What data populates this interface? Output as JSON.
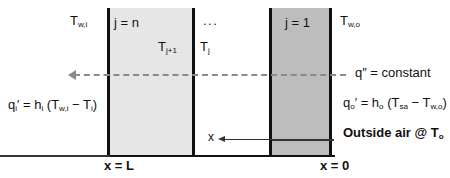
{
  "diagram": {
    "blocks": [
      {
        "id": "block-n",
        "label": "j = n",
        "fill": "#e6e6e6"
      },
      {
        "id": "block-mid",
        "label": "",
        "fill": "#ffffff"
      },
      {
        "id": "block-1",
        "label": "j = 1",
        "fill": "#bdbdbd"
      }
    ],
    "labels": {
      "t_wall_inner": "T",
      "t_wall_inner_sub": "w,i",
      "node_n": "j = n",
      "t_j_plus_1": "T",
      "t_j_plus_1_sub": "j+1",
      "ellipsis": "...",
      "t_j": "T",
      "t_j_sub": "j",
      "node_1": "j = 1",
      "t_wall_outer": "T",
      "t_wall_outer_sub": "w,o",
      "x_label": "x",
      "x_equals_L": "x = L",
      "x_equals_0": "x = 0"
    },
    "annotations": {
      "flux_constant": "q″ = constant",
      "inner_flux_eq": "qᵢ′ = hᵢ (Tᵥᵢ − Tᵢ)",
      "outer_flux_eq": "qₒ′ = hₒ (Tₛₐ − Tᵥₒ)",
      "outside_air": "Outside air @ T",
      "outside_air_sub": "o"
    },
    "equation_parts": {
      "qi": {
        "q": "q",
        "q_sub": "i",
        "prime": "′",
        "eq": " = h",
        "h_sub": "i",
        "open": " (T",
        "tw_sub": "w,i",
        "minus": " − T",
        "ti_sub": "i",
        "close": ")"
      },
      "qo": {
        "q": "q",
        "q_sub": "o",
        "prime": "′",
        "eq": " = h",
        "h_sub": "o",
        "open": " (T",
        "tsa_sub": "sa",
        "minus": " − T",
        "two_sub": "w,o",
        "close": ")"
      }
    },
    "flux_text": {
      "q": "q",
      "prime": "″",
      "rest": " = constant"
    },
    "caption": "",
    "colors": {
      "outline": "#111111",
      "block_light": "#e6e6e6",
      "block_dark": "#bdbdbd",
      "dashed_arrow": "#8a8a8a",
      "background": "#ffffff"
    }
  }
}
